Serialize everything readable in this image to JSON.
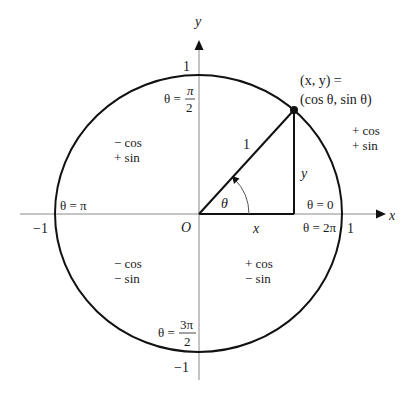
{
  "diagram": {
    "colors": {
      "curve": "#111111",
      "axis": "#8a8a8a",
      "text": "#1a1a1a"
    },
    "axes": {
      "x_label": "x",
      "y_label": "y",
      "origin_label": "O"
    },
    "ticks": {
      "pos_y": "1",
      "neg_y": "−1",
      "neg_x": "−1",
      "pos_x": "1"
    },
    "angle_labels": {
      "top_prefix": "θ =",
      "top_num": "π",
      "top_den": "2",
      "left": "θ = π",
      "right_top": "θ = 0",
      "right_bottom": "θ = 2π",
      "bottom_prefix": "θ =",
      "bottom_num": "3π",
      "bottom_den": "2"
    },
    "point": {
      "line1": "(x, y) =",
      "line2": "(cos θ, sin θ)"
    },
    "triangle": {
      "hypotenuse": "1",
      "opposite": "y",
      "adjacent": "x",
      "angle": "θ"
    },
    "quadrants": {
      "q1": {
        "cos": "+ cos",
        "sin": "+ sin"
      },
      "q2": {
        "cos": "− cos",
        "sin": "+ sin"
      },
      "q3": {
        "cos": "− cos",
        "sin": "− sin"
      },
      "q4": {
        "cos": "+ cos",
        "sin": "− sin"
      }
    }
  }
}
